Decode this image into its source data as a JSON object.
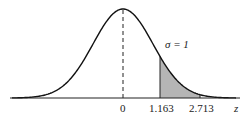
{
  "chart_data": {
    "type": "area",
    "title": "",
    "xlabel": "z",
    "ylabel": "",
    "tick_labels": [
      "0",
      "1.163",
      "2.713"
    ],
    "annotations": [
      "σ = 1"
    ],
    "shaded_region": {
      "from": 1.163,
      "to": 2.713
    },
    "mean": 0,
    "sd": 1,
    "grid": false
  },
  "labels": {
    "zero": "0",
    "a": "1.163",
    "b": "2.713",
    "axis": "z",
    "sigma": "σ = 1"
  }
}
